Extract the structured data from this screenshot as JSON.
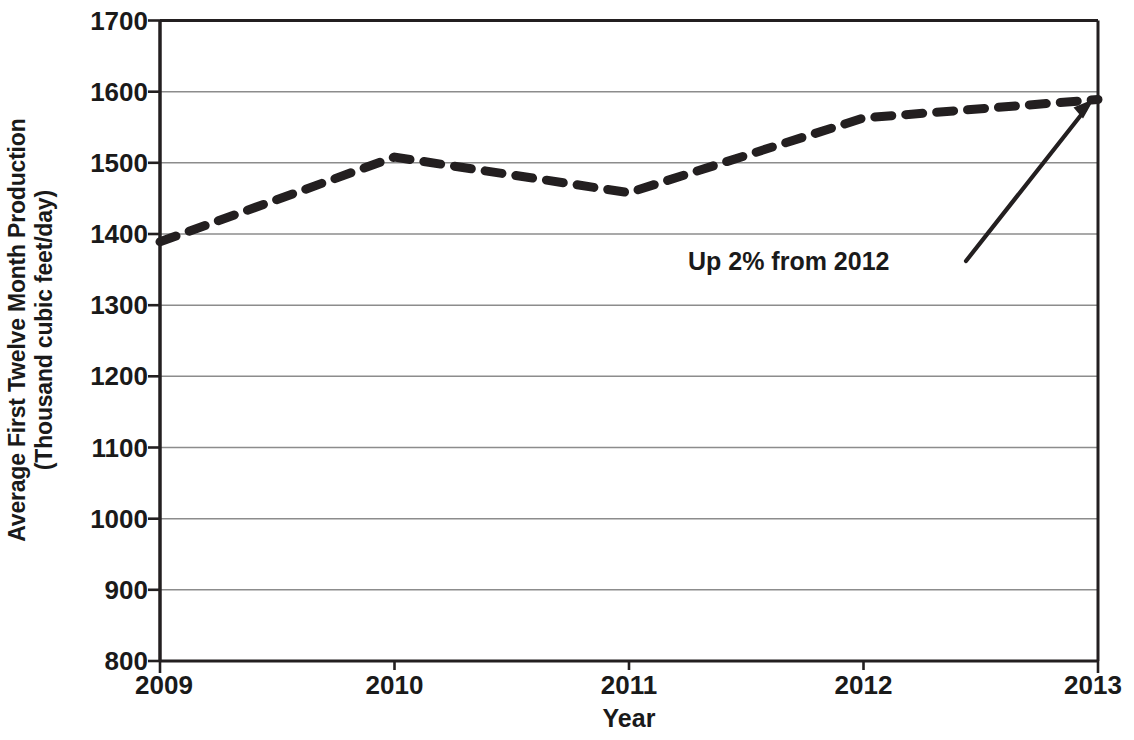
{
  "chart_data": {
    "type": "line",
    "title": "",
    "xlabel": "Year",
    "ylabel": "Average First Twelve Month Production (Thousand cubic feet/day)",
    "ylabel_line1": "Average First Twelve Month Production",
    "ylabel_line2": "(Thousand cubic feet/day)",
    "x": [
      2009,
      2010,
      2011,
      2012,
      2013
    ],
    "categories": [
      "2009",
      "2010",
      "2011",
      "2012",
      "2013"
    ],
    "values": [
      1389,
      1508,
      1458,
      1563,
      1589
    ],
    "series": [
      {
        "name": "Average First Twelve Month Production",
        "values": [
          1389,
          1508,
          1458,
          1563,
          1589
        ],
        "line_style": "dashed",
        "line_color": "#231f20",
        "line_width": 9
      }
    ],
    "xlim": [
      2009,
      2013
    ],
    "ylim": [
      800,
      1700
    ],
    "ytick_labels": [
      "800",
      "900",
      "1000",
      "1100",
      "1200",
      "1300",
      "1400",
      "1500",
      "1600",
      "1700"
    ],
    "ytick_values": [
      800,
      900,
      1000,
      1100,
      1200,
      1300,
      1400,
      1500,
      1600,
      1700
    ],
    "xtick_labels": [
      "2009",
      "2010",
      "2011",
      "2012",
      "2013"
    ],
    "xtick_values": [
      2009,
      2010,
      2011,
      2012,
      2013
    ],
    "grid": "horizontal",
    "grid_color": "#808080",
    "legend": "none",
    "annotations": [
      {
        "text": "Up 2% from 2012",
        "points_to_x": 2013,
        "points_to_y": 1589,
        "arrow": true
      }
    ],
    "axis_color": "#231f20",
    "background": "#ffffff"
  },
  "axes": {
    "y_title_line1": "Average First Twelve Month Production",
    "y_title_line2": "(Thousand cubic feet/day)",
    "x_title": "Year"
  },
  "annotation": {
    "label": "Up 2% from 2012"
  }
}
